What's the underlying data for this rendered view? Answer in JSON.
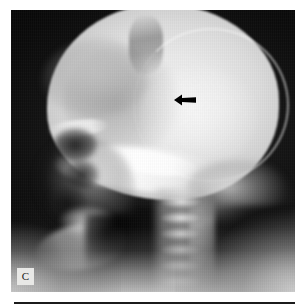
{
  "figure": {
    "kind": "radiograph",
    "modality": "plain-film-x-ray",
    "view": "lateral-skull",
    "panel_letter": "C",
    "background_color": "#ffffff",
    "film_color": "#000000",
    "bone_highlight_color": "#f2f2f2",
    "annotation_color": "#000000",
    "rule_color": "#1b1b1b"
  },
  "panel": {
    "label": "C",
    "label_box_color": "#e8e8e6",
    "label_text_color": "#1a1a1a"
  },
  "annotations": [
    {
      "name": "lesion-arrow",
      "glyph": "arrow-left-icon",
      "direction": "left",
      "x": 163,
      "y": 84,
      "width": 22,
      "height": 12,
      "color": "#000000"
    }
  ],
  "anatomy": [
    {
      "name": "cranial-vault"
    },
    {
      "name": "outer-table-rim"
    },
    {
      "name": "inner-table-line"
    },
    {
      "name": "lucent-lesion"
    },
    {
      "name": "frontal-bone-shadow"
    },
    {
      "name": "coronal-suture"
    },
    {
      "name": "scalp-soft-tissue"
    },
    {
      "name": "skull-base"
    },
    {
      "name": "petrous-ridge"
    },
    {
      "name": "orbit"
    },
    {
      "name": "orbital-roof"
    },
    {
      "name": "facial-bones"
    },
    {
      "name": "paranasal-sinus-upper"
    },
    {
      "name": "paranasal-sinus-lower"
    },
    {
      "name": "maxilla"
    },
    {
      "name": "mandible-ramus"
    },
    {
      "name": "occipital-bone"
    },
    {
      "name": "cervical-spine"
    },
    {
      "name": "spinous-processes"
    },
    {
      "name": "airway"
    }
  ],
  "geometry": {
    "panel_left": 11,
    "panel_top": 10,
    "panel_width": 284,
    "panel_height": 282,
    "rule_left": 14,
    "rule_top": 302,
    "rule_width": 281
  }
}
